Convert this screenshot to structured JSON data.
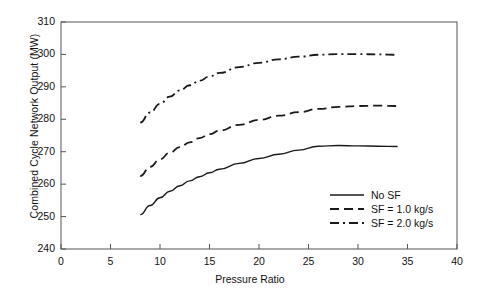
{
  "chart_data": {
    "type": "line",
    "title": "",
    "xlabel": "Pressure Ratio",
    "ylabel": "Combined Cycle Network Output (MW)",
    "xlim": [
      0,
      40
    ],
    "ylim": [
      240,
      310
    ],
    "xticks": [
      0,
      5,
      10,
      15,
      20,
      25,
      30,
      35,
      40
    ],
    "yticks": [
      240,
      250,
      260,
      270,
      280,
      290,
      300,
      310
    ],
    "grid": false,
    "legend_position": "lower-right-inside",
    "series": [
      {
        "name": "No SF",
        "style": "solid",
        "x": [
          8,
          9,
          10,
          11,
          12,
          13,
          14,
          15,
          16,
          18,
          20,
          22,
          24,
          26,
          28,
          30,
          32,
          34
        ],
        "y": [
          250.6,
          253.4,
          255.8,
          257.8,
          259.5,
          261.0,
          262.3,
          263.5,
          264.6,
          266.4,
          267.9,
          269.2,
          270.5,
          271.7,
          271.9,
          271.8,
          271.7,
          271.6
        ]
      },
      {
        "name": "SF = 1.0 kg/s",
        "style": "dashed",
        "x": [
          8,
          9,
          10,
          11,
          12,
          13,
          14,
          15,
          16,
          18,
          20,
          22,
          24,
          26,
          28,
          30,
          32,
          34
        ],
        "y": [
          262.5,
          265.3,
          267.7,
          269.7,
          271.4,
          272.9,
          274.2,
          275.4,
          276.5,
          278.3,
          279.8,
          281.1,
          282.2,
          283.2,
          283.8,
          284.1,
          284.2,
          284.1
        ]
      },
      {
        "name": "SF = 2.0 kg/s",
        "style": "dashdot",
        "x": [
          8,
          9,
          10,
          11,
          12,
          13,
          14,
          15,
          16,
          18,
          20,
          22,
          24,
          26,
          28,
          30,
          32,
          34
        ],
        "y": [
          279.0,
          282.1,
          284.8,
          287.0,
          288.9,
          290.5,
          291.9,
          293.2,
          294.3,
          296.1,
          297.4,
          298.5,
          299.3,
          299.9,
          300.1,
          300.1,
          300.0,
          299.9
        ]
      }
    ]
  },
  "legend": {
    "items": [
      {
        "label": "No SF"
      },
      {
        "label": "SF = 1.0 kg/s"
      },
      {
        "label": "SF = 2.0 kg/s"
      }
    ]
  },
  "axes": {
    "x_tick_labels": [
      "0",
      "5",
      "10",
      "15",
      "20",
      "25",
      "30",
      "35",
      "40"
    ],
    "y_tick_labels": [
      "240",
      "250",
      "260",
      "270",
      "280",
      "290",
      "300",
      "310"
    ],
    "x_title": "Pressure Ratio",
    "y_title": "Combined Cycle Network Output (MW)"
  },
  "colors": {
    "line": "#1a1a1a",
    "frame": "#555555",
    "background": "#ffffff"
  }
}
